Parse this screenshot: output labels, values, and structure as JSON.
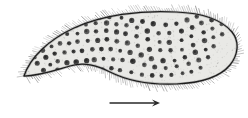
{
  "figure": {
    "domain": "natural-image",
    "caption": "",
    "canvas": {
      "width": 248,
      "height": 118,
      "background": "#ffffff"
    },
    "colors": {
      "background": "#ffffff",
      "outline": "#1d1d1d",
      "cytoplasm_fill": "#e9e9e6",
      "granule": "#3a3a3a",
      "granule_core": "#1b1b1b",
      "cilia": "#4a4a4a",
      "stipple": "#b9b9b6",
      "arrow": "#2a2a2a"
    }
  },
  "organism": {
    "label": "ciliate-body",
    "shape": "crescent",
    "outline_path": "M 24 76 C 30 58 48 40 74 28 C 102 15 140 10 176 12 C 202 13 222 20 232 32 C 240 42 238 55 230 65 C 220 77 200 83 176 84 C 150 85 126 80 110 72 C 96 65 84 62 70 66 C 56 70 40 76 24 76 Z",
    "anterior_end": "left-pointed-tip",
    "posterior_end": "right-rounded-end",
    "dorsal_margin": "convex-upper",
    "ventral_margin": "concave-lower"
  },
  "cilia": {
    "label": "cilia-fringe",
    "description": "dense fine hair fringe around entire pellicle margin",
    "count": 210,
    "length_px": [
      3,
      9
    ],
    "stroke_width": 0.45
  },
  "granules": {
    "label": "cytoplasmic-granules",
    "description": "dark rounded granules scattered through the cytoplasm",
    "radius_px": 2.3,
    "points": [
      [
        58,
        70
      ],
      [
        66,
        73
      ],
      [
        74,
        72
      ],
      [
        84,
        71
      ],
      [
        93,
        70
      ],
      [
        102,
        69
      ],
      [
        111,
        69
      ],
      [
        120,
        70
      ],
      [
        131,
        72
      ],
      [
        142,
        74
      ],
      [
        152,
        75
      ],
      [
        162,
        75
      ],
      [
        172,
        75
      ],
      [
        182,
        73
      ],
      [
        192,
        71
      ],
      [
        200,
        68
      ],
      [
        44,
        70
      ],
      [
        50,
        64
      ],
      [
        58,
        62
      ],
      [
        67,
        62
      ],
      [
        76,
        62
      ],
      [
        86,
        61
      ],
      [
        95,
        60
      ],
      [
        104,
        59
      ],
      [
        113,
        59
      ],
      [
        123,
        60
      ],
      [
        133,
        62
      ],
      [
        144,
        65
      ],
      [
        155,
        67
      ],
      [
        166,
        68
      ],
      [
        177,
        67
      ],
      [
        188,
        64
      ],
      [
        198,
        60
      ],
      [
        208,
        57
      ],
      [
        38,
        64
      ],
      [
        46,
        57
      ],
      [
        55,
        54
      ],
      [
        64,
        53
      ],
      [
        73,
        52
      ],
      [
        82,
        51
      ],
      [
        92,
        50
      ],
      [
        101,
        49
      ],
      [
        110,
        49
      ],
      [
        120,
        50
      ],
      [
        130,
        52
      ],
      [
        141,
        55
      ],
      [
        152,
        58
      ],
      [
        163,
        60
      ],
      [
        174,
        60
      ],
      [
        185,
        57
      ],
      [
        196,
        53
      ],
      [
        206,
        49
      ],
      [
        214,
        46
      ],
      [
        34,
        57
      ],
      [
        42,
        50
      ],
      [
        51,
        46
      ],
      [
        60,
        44
      ],
      [
        69,
        43
      ],
      [
        78,
        42
      ],
      [
        88,
        41
      ],
      [
        97,
        40
      ],
      [
        107,
        40
      ],
      [
        117,
        41
      ],
      [
        127,
        43
      ],
      [
        138,
        46
      ],
      [
        149,
        49
      ],
      [
        160,
        51
      ],
      [
        171,
        51
      ],
      [
        182,
        49
      ],
      [
        193,
        45
      ],
      [
        204,
        41
      ],
      [
        214,
        37
      ],
      [
        222,
        34
      ],
      [
        40,
        42
      ],
      [
        49,
        38
      ],
      [
        58,
        35
      ],
      [
        67,
        34
      ],
      [
        77,
        33
      ],
      [
        86,
        32
      ],
      [
        96,
        31
      ],
      [
        106,
        31
      ],
      [
        116,
        32
      ],
      [
        126,
        34
      ],
      [
        137,
        37
      ],
      [
        148,
        40
      ],
      [
        159,
        42
      ],
      [
        170,
        42
      ],
      [
        181,
        40
      ],
      [
        192,
        36
      ],
      [
        203,
        32
      ],
      [
        213,
        28
      ],
      [
        221,
        25
      ],
      [
        56,
        28
      ],
      [
        66,
        26
      ],
      [
        76,
        25
      ],
      [
        86,
        24
      ],
      [
        96,
        23
      ],
      [
        106,
        23
      ],
      [
        116,
        24
      ],
      [
        126,
        26
      ],
      [
        137,
        28
      ],
      [
        148,
        31
      ],
      [
        159,
        33
      ],
      [
        170,
        33
      ],
      [
        181,
        31
      ],
      [
        192,
        27
      ],
      [
        202,
        23
      ],
      [
        211,
        20
      ],
      [
        80,
        19
      ],
      [
        90,
        18
      ],
      [
        100,
        17
      ],
      [
        110,
        17
      ],
      [
        121,
        18
      ],
      [
        132,
        20
      ],
      [
        143,
        22
      ],
      [
        154,
        24
      ],
      [
        165,
        25
      ],
      [
        176,
        23
      ],
      [
        187,
        20
      ],
      [
        197,
        17
      ]
    ]
  },
  "stipple": {
    "label": "cytoplasm-stipple",
    "description": "fine grey speckle texture filling the cell interior",
    "dot_count": 900,
    "dot_radius_px": 0.42
  },
  "arrow": {
    "label": "direction-of-movement-arrow",
    "caption": "",
    "direction": "right",
    "x_start": 110,
    "x_end": 160,
    "y": 103,
    "stroke_width": 1.3,
    "head_length_px": 8,
    "head_half_width_px": 3.6
  }
}
